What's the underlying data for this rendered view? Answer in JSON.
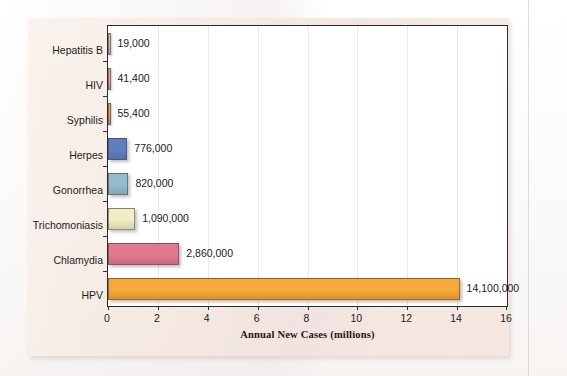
{
  "figure": {
    "panel_bg": "#f5e9e1",
    "plot_bg": "#ffffff",
    "frame_color": "#2e2a28"
  },
  "chart_data": {
    "type": "bar",
    "orientation": "horizontal",
    "title": "",
    "xlabel": "Annual New Cases (millions)",
    "ylabel": "",
    "xlim": [
      0,
      16
    ],
    "xticks": [
      0,
      2,
      4,
      6,
      8,
      10,
      12,
      14,
      16
    ],
    "xtick_labels": [
      "0",
      "2",
      "4",
      "6",
      "8",
      "10",
      "12",
      "14",
      "16"
    ],
    "grid": "vertical-faint",
    "legend": "none",
    "categories": [
      "Hepatitis B",
      "HIV",
      "Syphilis",
      "Herpes",
      "Gonorrhea",
      "Trichomoniasis",
      "Chlamydia",
      "HPV"
    ],
    "values": [
      19000,
      41400,
      55400,
      776000,
      820000,
      1090000,
      2860000,
      14100000
    ],
    "values_millions": [
      0.019,
      0.0414,
      0.0554,
      0.776,
      0.82,
      1.09,
      2.86,
      14.1
    ],
    "data_labels": [
      "19,000",
      "41,400",
      "55,400",
      "776,000",
      "820,000",
      "1,090,000",
      "2,860,000",
      "14,100,000"
    ],
    "bar_colors": [
      "#d9b8ae",
      "#e0a8a4",
      "#dfa46a",
      "#5f7fc2",
      "#94bccd",
      "#efeec4",
      "#e2798f",
      "#f6a93b"
    ],
    "bars": [
      {
        "category": "Hepatitis B",
        "value": 19000,
        "value_millions": 0.019,
        "label": "19,000",
        "color": "#d9b8ae"
      },
      {
        "category": "HIV",
        "value": 41400,
        "value_millions": 0.0414,
        "label": "41,400",
        "color": "#e0a8a4"
      },
      {
        "category": "Syphilis",
        "value": 55400,
        "value_millions": 0.0554,
        "label": "55,400",
        "color": "#dfa46a"
      },
      {
        "category": "Herpes",
        "value": 776000,
        "value_millions": 0.776,
        "label": "776,000",
        "color": "#5f7fc2"
      },
      {
        "category": "Gonorrhea",
        "value": 820000,
        "value_millions": 0.82,
        "label": "820,000",
        "color": "#94bccd"
      },
      {
        "category": "Trichomoniasis",
        "value": 1090000,
        "value_millions": 1.09,
        "label": "1,090,000",
        "color": "#efeec4"
      },
      {
        "category": "Chlamydia",
        "value": 2860000,
        "value_millions": 2.86,
        "label": "2,860,000",
        "color": "#e2798f"
      },
      {
        "category": "HPV",
        "value": 14100000,
        "value_millions": 14.1,
        "label": "14,100,000",
        "color": "#f6a93b"
      }
    ]
  },
  "page_bleed": {
    "line1": "",
    "line2": ""
  }
}
